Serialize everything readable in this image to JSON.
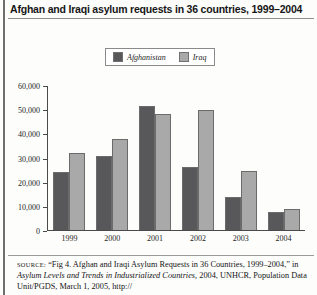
{
  "figure": {
    "title": "Afghan and Iraqi asylum requests in 36 countries, 1999–2004",
    "source_kicker": "SOURCE:",
    "source_line1": "“Fig 4. Afghan and Iraqi Asylum Requests in 36 Countries,",
    "source_line2_plain": "1999–2004,” in ",
    "source_line2_italic": "Asylum Levels and Trends in Industrialized Countries,",
    "source_line3": "2004, UNHCR, Population Data Unit/PGDS, March 1, 2005, http://"
  },
  "legend": {
    "items": [
      {
        "label": "Afghanistan",
        "color": "#58585a"
      },
      {
        "label": "Iraq",
        "color": "#a9a9a9"
      }
    ]
  },
  "chart_data": {
    "type": "bar",
    "title": "Afghan and Iraqi asylum requests in 36 countries, 1999–2004",
    "xlabel": "",
    "ylabel": "",
    "categories": [
      "1999",
      "2000",
      "2001",
      "2002",
      "2003",
      "2004"
    ],
    "series": [
      {
        "name": "Afghanistan",
        "color": "#58585a",
        "values": [
          24000,
          30500,
          51500,
          26000,
          13500,
          7500
        ]
      },
      {
        "name": "Iraq",
        "color": "#a9a9a9",
        "values": [
          32000,
          37500,
          48000,
          49500,
          24500,
          8500
        ]
      }
    ],
    "ylim": [
      0,
      60000
    ],
    "ytick_values": [
      0,
      10000,
      20000,
      30000,
      40000,
      50000,
      60000
    ],
    "ytick_labels": [
      "0",
      "10,000",
      "20,000",
      "30,000",
      "40,000",
      "50,000",
      "60,000"
    ],
    "grid": false,
    "legend_position": "top-center"
  }
}
